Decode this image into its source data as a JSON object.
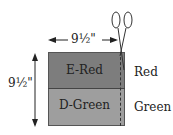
{
  "diagram": {
    "top_strip": {
      "label": "E-Red",
      "color": "#7d7d7d"
    },
    "bottom_strip": {
      "label": "D-Green",
      "color": "#9e9e9e"
    },
    "side_labels": {
      "top": "Red",
      "bottom": "Green"
    },
    "width_dimension": "9½\"",
    "height_dimension": "9½\"",
    "cut_line": "dashed",
    "tool_icon": "scissors-icon"
  }
}
